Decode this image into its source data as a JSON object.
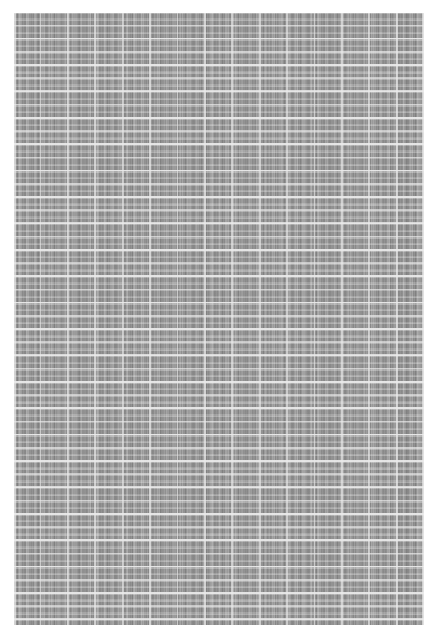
{
  "page": {
    "kind": "scanned-document-page",
    "legibility": "illegible",
    "note": "Text is not resolvable at the captured resolution; rendered as grey texture.",
    "background_color": "#ffffff",
    "content_tone": "#9a9a9a",
    "gridline_color": "#ffffff",
    "margins_px": {
      "left": 14,
      "top": 13,
      "right": 14,
      "bottom": 16
    }
  },
  "content_block": {
    "label": "dense-tabular-text-block",
    "x": 14,
    "y": 13,
    "width": 410,
    "height": 612,
    "approx_column_pitch_px": 27,
    "approx_row_pitch_px": 13,
    "approx_major_row_pitch_px": 26,
    "approx_column_count": 15,
    "approx_row_count": 47
  },
  "text": {
    "body": ""
  }
}
